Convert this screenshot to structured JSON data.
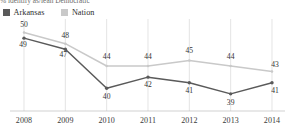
{
  "title": {
    "partial_text": "% identify as/lean Democratic"
  },
  "legend": {
    "items": [
      {
        "label": "Arkansas",
        "color": "#5a5a5a",
        "swatch_name": "legend-swatch-arkansas"
      },
      {
        "label": "Nation",
        "color": "#c9c9c9",
        "swatch_name": "legend-swatch-nation"
      }
    ]
  },
  "axis": {
    "x_ticks": [
      "2008",
      "2009",
      "2010",
      "2011",
      "2012",
      "2013",
      "2014"
    ],
    "y_min": 37,
    "y_max": 51,
    "grid": "vertical"
  },
  "chart_data": {
    "type": "line",
    "title": "% identify as/lean Democratic",
    "xlabel": "",
    "ylabel": "",
    "categories": [
      "2008",
      "2009",
      "2010",
      "2011",
      "2012",
      "2013",
      "2014"
    ],
    "ylim": [
      37,
      51
    ],
    "grid": true,
    "legend_position": "top-left",
    "series": [
      {
        "name": "Arkansas",
        "color": "#5a5a5a",
        "values": [
          49,
          47,
          40,
          42,
          41,
          39,
          41
        ],
        "labels": [
          "49",
          "47",
          "40",
          "42",
          "41",
          "39",
          "41"
        ]
      },
      {
        "name": "Nation",
        "color": "#c9c9c9",
        "values": [
          50,
          48,
          44,
          44,
          45,
          44,
          43
        ],
        "labels": [
          "50",
          "48",
          "44",
          "44",
          "45",
          "44",
          "43"
        ]
      }
    ]
  }
}
